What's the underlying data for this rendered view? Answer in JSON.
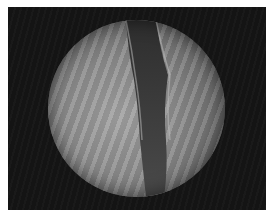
{
  "image": {
    "description": "Grayscale endoscopic view: circular field of view showing tissue folds with a dark vertical lumen/channel",
    "colors": {
      "background_frame": "#141414",
      "tissue_light": "#a4a4a4",
      "tissue_mid": "#8e8e8e",
      "channel_dark": "#3a3a3a",
      "border": "#ffffff"
    }
  }
}
